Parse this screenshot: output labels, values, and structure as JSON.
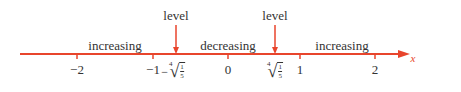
{
  "axis": {
    "variable": "x",
    "color": "#e8452c"
  },
  "ticks": [
    {
      "label": "−2",
      "x": 77
    },
    {
      "label": "−1",
      "x": 153
    },
    {
      "label": "0",
      "x": 228
    },
    {
      "label": "1",
      "x": 300
    },
    {
      "label": "2",
      "x": 375
    }
  ],
  "regions": [
    {
      "label": "increasing",
      "x": 115
    },
    {
      "label": "decreasing",
      "x": 228
    },
    {
      "label": "increasing",
      "x": 342
    }
  ],
  "critical_points": [
    {
      "annotation": "level",
      "x": 176,
      "sign": "−",
      "index": "4",
      "num": "1",
      "den": "5"
    },
    {
      "annotation": "level",
      "x": 275,
      "sign": "",
      "index": "4",
      "num": "1",
      "den": "5"
    }
  ]
}
